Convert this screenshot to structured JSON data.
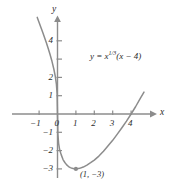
{
  "figure": {
    "axis_labels": {
      "x": "x",
      "y": "y"
    },
    "equation_label": {
      "lhs": "y = ",
      "base": "x",
      "exponent": "1/3",
      "factor": "(x − 4)",
      "full": "y = x^(1/3)(x − 4)"
    },
    "point_label": "(1, −3)"
  },
  "chart_data": {
    "type": "line",
    "title": "",
    "xlabel": "x",
    "ylabel": "y",
    "equation": "y = x^(1/3)(x - 4)",
    "xlim": [
      -1.35,
      4.85
    ],
    "ylim": [
      -3.65,
      4.9
    ],
    "grid": false,
    "legend": "none",
    "x_ticks": [
      -1,
      0,
      1,
      2,
      3,
      4
    ],
    "x_tick_labels": [
      "−1",
      "0",
      "1",
      "2",
      "3",
      "4"
    ],
    "y_ticks": [
      -3,
      -2,
      -1,
      1,
      2,
      3,
      4
    ],
    "y_tick_labels": [
      "−3",
      "−2",
      "−1",
      "1",
      "2",
      "3",
      "4"
    ],
    "y_unlabeled_ticks": [
      3
    ],
    "annotations": [
      {
        "text": "y = x^(1/3)(x − 4)",
        "x": 2.1,
        "y": 3.0
      },
      {
        "text": "(1, −3)",
        "x": 1.35,
        "y": -3.45
      }
    ],
    "markers": [
      {
        "label": "minimum",
        "x": 1,
        "y": -3
      }
    ],
    "x_intercepts": [
      0,
      4
    ],
    "series": [
      {
        "name": "y = x^(1/3)(x - 4)",
        "color": "#8c8c8c",
        "points": [
          {
            "x": -1.1,
            "y": 5.28
          },
          {
            "x": -1.0,
            "y": 5.0
          },
          {
            "x": -0.9,
            "y": 4.72
          },
          {
            "x": -0.8,
            "y": 4.45
          },
          {
            "x": -0.7,
            "y": 4.17
          },
          {
            "x": -0.6,
            "y": 3.88
          },
          {
            "x": -0.5,
            "y": 3.57
          },
          {
            "x": -0.4,
            "y": 3.24
          },
          {
            "x": -0.3,
            "y": 2.88
          },
          {
            "x": -0.2,
            "y": 2.46
          },
          {
            "x": -0.12,
            "y": 2.06
          },
          {
            "x": -0.06,
            "y": 1.63
          },
          {
            "x": -0.02,
            "y": 1.09
          },
          {
            "x": 0.0,
            "y": 0.0
          },
          {
            "x": 0.02,
            "y": -1.08
          },
          {
            "x": 0.06,
            "y": -1.6
          },
          {
            "x": 0.12,
            "y": -1.97
          },
          {
            "x": 0.2,
            "y": -2.22
          },
          {
            "x": 0.3,
            "y": -2.49
          },
          {
            "x": 0.4,
            "y": -2.65
          },
          {
            "x": 0.5,
            "y": -2.78
          },
          {
            "x": 0.6,
            "y": -2.87
          },
          {
            "x": 0.7,
            "y": -2.93
          },
          {
            "x": 0.8,
            "y": -2.97
          },
          {
            "x": 0.9,
            "y": -2.99
          },
          {
            "x": 1.0,
            "y": -3.0
          },
          {
            "x": 1.2,
            "y": -2.97
          },
          {
            "x": 1.4,
            "y": -2.9
          },
          {
            "x": 1.6,
            "y": -2.79
          },
          {
            "x": 1.8,
            "y": -2.66
          },
          {
            "x": 2.0,
            "y": -2.52
          },
          {
            "x": 2.25,
            "y": -2.3
          },
          {
            "x": 2.5,
            "y": -2.04
          },
          {
            "x": 2.75,
            "y": -1.74
          },
          {
            "x": 3.0,
            "y": -1.44
          },
          {
            "x": 3.25,
            "y": -1.1
          },
          {
            "x": 3.5,
            "y": -0.75
          },
          {
            "x": 3.75,
            "y": -0.39
          },
          {
            "x": 4.0,
            "y": 0.0
          },
          {
            "x": 4.25,
            "y": 0.41
          },
          {
            "x": 4.5,
            "y": 0.85
          },
          {
            "x": 4.7,
            "y": 1.2
          }
        ]
      }
    ]
  }
}
